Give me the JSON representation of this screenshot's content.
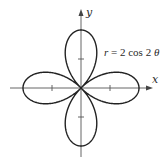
{
  "chart_data": {
    "type": "line",
    "subtype": "polar-rose",
    "title": "",
    "equation": "r = 2 cos 2θ",
    "equation_parts": {
      "lhs": "r",
      "rhs_prefix": "= 2 cos 2",
      "theta": "θ"
    },
    "xlabel": "x",
    "ylabel": "y",
    "xlim": [
      -2.5,
      2.5
    ],
    "ylim": [
      -2.5,
      2.5
    ],
    "x_ticks": [
      -1,
      1
    ],
    "y_ticks": [
      -1,
      1
    ],
    "tick_labels_shown": false,
    "grid": false,
    "legend": null,
    "series": [
      {
        "name": "r = 2 cos 2θ",
        "petals": 4,
        "max_r": 2,
        "petal_tips": [
          [
            2,
            0
          ],
          [
            0,
            2
          ],
          [
            -2,
            0
          ],
          [
            0,
            -2
          ]
        ],
        "theta_deg": [
          0,
          15,
          30,
          45,
          60,
          75,
          90,
          105,
          120,
          135,
          150,
          165,
          180
        ],
        "r": [
          2,
          1.732,
          1,
          0,
          -1,
          -1.732,
          -2,
          -1.732,
          -1,
          0,
          1,
          1.732,
          2
        ]
      }
    ],
    "colors": {
      "curve": "#222222",
      "axes": "#555555"
    }
  },
  "labels": {
    "x_axis": "x",
    "y_axis": "y",
    "equation_r": "r",
    "equation_rest": "= 2 cos 2",
    "equation_theta": "θ"
  }
}
